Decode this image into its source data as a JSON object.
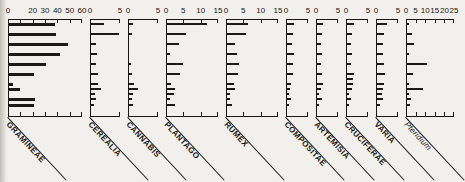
{
  "figure": {
    "kind": "multi-panel horizontal bar (pollen diagram)",
    "sample_count": 17
  },
  "chart_data": {
    "type": "bar",
    "xlabel": "",
    "ylabel": "",
    "orientation": "horizontal",
    "grid": false,
    "legend": "none",
    "categories": [
      "s1",
      "s2",
      "s3",
      "s4",
      "s5",
      "s6",
      "s7",
      "s8",
      "s9",
      "s10",
      "s11",
      "s12",
      "s13",
      "s14",
      "s15",
      "s16",
      "s17"
    ],
    "row_y": [
      23,
      28,
      33,
      38,
      43,
      48,
      53,
      58,
      63,
      68,
      73,
      78,
      83,
      88,
      93,
      98,
      104
    ],
    "series": [
      {
        "name": "GRAMINEAE",
        "label": "GRAMINEAE",
        "italic": false,
        "xlim": [
          0,
          60
        ],
        "ticks": [
          0,
          10,
          20,
          30,
          40,
          50,
          60
        ],
        "tick_labels": [
          "0",
          "",
          "20",
          "30",
          "40",
          "50",
          "60"
        ],
        "values": [
          37,
          0,
          38,
          0,
          48,
          0,
          41,
          0,
          30,
          0,
          20,
          0,
          3,
          9,
          0,
          21,
          20
        ]
      },
      {
        "name": "CEREALIA",
        "label": "CEREALIA",
        "italic": false,
        "xlim": [
          0,
          5
        ],
        "ticks": [
          0,
          5
        ],
        "tick_labels": [
          "0",
          "5"
        ],
        "values": [
          2.1,
          0,
          4.6,
          0,
          0.8,
          0,
          1.0,
          0,
          0.9,
          0,
          1.2,
          0,
          1.1,
          1.7,
          0.7,
          0.9,
          0.5
        ]
      },
      {
        "name": "CANNABIS",
        "label": "CANNABIS",
        "italic": false,
        "xlim": [
          0,
          5
        ],
        "ticks": [
          0,
          5
        ],
        "tick_labels": [
          "0",
          "5"
        ],
        "values": [
          0.6,
          0,
          0.5,
          0,
          0,
          0,
          0,
          0,
          0.4,
          0,
          0.5,
          0,
          0.9,
          1.5,
          0.6,
          0.5,
          0.6
        ]
      },
      {
        "name": "PLANTAGO",
        "label": "PLANTAGO",
        "italic": false,
        "xlim": [
          0,
          15
        ],
        "ticks": [
          0,
          5,
          10,
          15
        ],
        "tick_labels": [
          "0",
          "5",
          "10",
          "15"
        ],
        "values": [
          11.5,
          0,
          5.4,
          0,
          3.4,
          0,
          1.0,
          0,
          4.6,
          0,
          3.8,
          0,
          1.2,
          2.4,
          1.9,
          1.0,
          2.4
        ]
      },
      {
        "name": "RUMEX",
        "label": "RUMEX",
        "italic": false,
        "xlim": [
          0,
          15
        ],
        "ticks": [
          0,
          5,
          10,
          15
        ],
        "tick_labels": [
          "0",
          "5",
          "10",
          "15"
        ],
        "values": [
          6.2,
          0,
          5.6,
          0,
          2.4,
          0,
          2.8,
          0,
          3.6,
          0,
          3.1,
          0,
          1.9,
          2.3,
          1.0,
          0.9,
          1.5
        ]
      },
      {
        "name": "COMPOSITAE",
        "label": "COMPOSITAE",
        "italic": false,
        "xlim": [
          0,
          5
        ],
        "ticks": [
          0,
          5
        ],
        "tick_labels": [
          "0",
          "5"
        ],
        "values": [
          1.6,
          0,
          1.4,
          0,
          1.1,
          0,
          1.5,
          0,
          1.4,
          0,
          1.3,
          0,
          0.8,
          0.6,
          0.5,
          1.0,
          0.4
        ]
      },
      {
        "name": "ARTEMISIA",
        "label": "ARTEMISIA",
        "italic": false,
        "xlim": [
          0,
          5
        ],
        "ticks": [
          0,
          5
        ],
        "tick_labels": [
          "0",
          "5"
        ],
        "values": [
          1.3,
          0,
          1.1,
          0,
          1.0,
          0,
          1.1,
          0,
          1.0,
          0,
          1.1,
          0,
          1.4,
          1.0,
          0.5,
          1.2,
          0.4
        ]
      },
      {
        "name": "CRUCIFERAE",
        "label": "CRUCIFERAE",
        "italic": false,
        "xlim": [
          0,
          5
        ],
        "ticks": [
          0,
          5
        ],
        "tick_labels": [
          "0",
          "5"
        ],
        "values": [
          1.6,
          0,
          1.1,
          0,
          0.9,
          0,
          1.2,
          0,
          0.8,
          0,
          1.5,
          1.4,
          1.3,
          1.2,
          0.5,
          1.0,
          0.4
        ]
      },
      {
        "name": "VARIA",
        "label": "VARIA",
        "italic": false,
        "xlim": [
          0,
          5
        ],
        "ticks": [
          0,
          5
        ],
        "tick_labels": [
          "0",
          "5"
        ],
        "values": [
          2.2,
          0,
          1.6,
          0,
          1.4,
          0,
          1.3,
          0,
          1.5,
          0,
          1.8,
          0,
          1.6,
          1.3,
          1.1,
          1.4,
          0.7
        ]
      },
      {
        "name": "Pteridium",
        "label": "Pteridium",
        "italic": true,
        "xlim": [
          0,
          25
        ],
        "ticks": [
          0,
          5,
          10,
          15,
          20,
          25
        ],
        "tick_labels": [
          "0",
          "5",
          "10",
          "15",
          "20",
          "25"
        ],
        "values": [
          1.2,
          0,
          2.6,
          0,
          3.4,
          0,
          1.2,
          0,
          10.5,
          0,
          3.2,
          0,
          1.0,
          8.5,
          0.9,
          2.0,
          1.4
        ]
      }
    ]
  },
  "panels_layout": [
    {
      "left": 8,
      "width": 74
    },
    {
      "left": 90,
      "width": 30
    },
    {
      "left": 128,
      "width": 30
    },
    {
      "left": 166,
      "width": 52
    },
    {
      "left": 226,
      "width": 52
    },
    {
      "left": 286,
      "width": 22
    },
    {
      "left": 316,
      "width": 22
    },
    {
      "left": 346,
      "width": 22
    },
    {
      "left": 376,
      "width": 22
    },
    {
      "left": 406,
      "width": 48
    }
  ]
}
